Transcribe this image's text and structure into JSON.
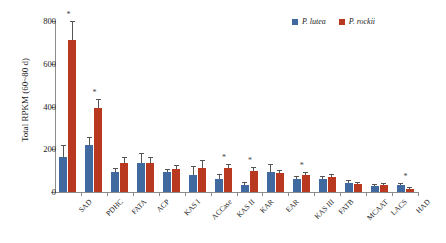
{
  "chart_data": {
    "type": "bar",
    "title": "",
    "xlabel": "",
    "ylabel": "Total RPKM (60~80 d)",
    "ylim": [
      0,
      800
    ],
    "yticks": [
      0,
      200,
      400,
      600,
      800
    ],
    "ytick_labels": [
      "0",
      "200",
      "400",
      "600",
      "800"
    ],
    "grid": false,
    "legend_position": "top-right",
    "categories": [
      "SAD",
      "PDHC",
      "FATA",
      "ACP",
      "KAS I",
      "ACCase",
      "KAS II",
      "KAR",
      "EAR",
      "KAS III",
      "FATB",
      "MCAAT",
      "LACS",
      "HAD"
    ],
    "series": [
      {
        "name": "P. lutea",
        "color": "#40699f",
        "values": [
          165,
          222,
          92,
          135,
          95,
          78,
          60,
          35,
          95,
          62,
          62,
          42,
          30,
          32
        ],
        "errors": [
          48,
          30,
          16,
          45,
          10,
          38,
          18,
          8,
          32,
          9,
          9,
          8,
          5,
          6
        ]
      },
      {
        "name": "P. rockii",
        "color": "#b8391f",
        "values": [
          710,
          392,
          137,
          137,
          110,
          112,
          112,
          100,
          88,
          78,
          72,
          38,
          32,
          13
        ],
        "errors": [
          85,
          38,
          22,
          22,
          12,
          33,
          15,
          13,
          12,
          11,
          9,
          6,
          5,
          4
        ]
      }
    ],
    "significance_marker": "*",
    "significant_categories": [
      "SAD",
      "PDHC",
      "KAS II",
      "KAR",
      "KAS III",
      "HAD"
    ]
  },
  "legend": {
    "entries": [
      {
        "label": "P. lutea",
        "color": "#40699f"
      },
      {
        "label": "P. rockii",
        "color": "#b8391f"
      }
    ]
  },
  "axes": {
    "y_title": "Total RPKM (60~80 d)"
  }
}
